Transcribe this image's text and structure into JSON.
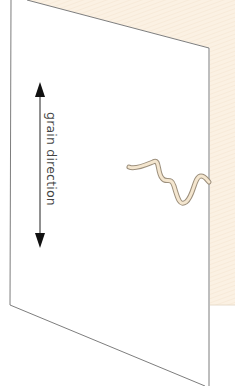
{
  "diagram": {
    "label": "grain direction",
    "colors": {
      "background_panel": "#fbf1e3",
      "sheet": "#ffffff",
      "outline": "#6e6e6e",
      "arrow": "#111111",
      "squiggle_fill": "#f4e6cf",
      "squiggle_stroke": "#9c8f7c"
    }
  }
}
